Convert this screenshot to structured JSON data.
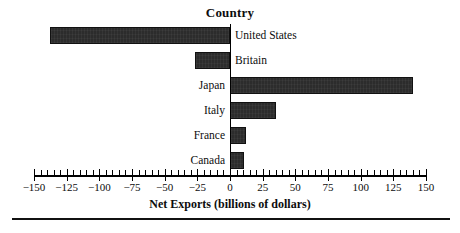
{
  "chart_data": {
    "type": "bar",
    "orientation": "horizontal",
    "title": "Country",
    "xlabel": "Net Exports (billions of dollars)",
    "ylabel": "Country",
    "categories": [
      "United States",
      "Britain",
      "Japan",
      "Italy",
      "France",
      "Canada"
    ],
    "values": [
      -138,
      -27,
      140,
      35,
      12,
      11
    ],
    "xlim": [
      -150,
      150
    ],
    "xticks": [
      -150,
      -125,
      -100,
      -75,
      -50,
      -25,
      0,
      25,
      50,
      75,
      100,
      125,
      150
    ],
    "xtick_labels": [
      "−150",
      "−125",
      "−100",
      "−75",
      "−50",
      "−25",
      "0",
      "25",
      "50",
      "75",
      "100",
      "125",
      "150"
    ],
    "minor_tick_interval": 5,
    "grid": false,
    "legend": null,
    "bar_color": "#2c2c2c",
    "axis_color": "#000000",
    "background_color": "#ffffff"
  },
  "chart": {
    "title": "Country",
    "x_axis_title": "Net Exports (billions of dollars)",
    "bars": [
      {
        "label": "United States",
        "value": -138
      },
      {
        "label": "Britain",
        "value": -27
      },
      {
        "label": "Japan",
        "value": 140
      },
      {
        "label": "Italy",
        "value": 35
      },
      {
        "label": "France",
        "value": 12
      },
      {
        "label": "Canada",
        "value": 11
      }
    ],
    "axis": {
      "min": -150,
      "max": 150,
      "major_step": 25,
      "minor_step": 5,
      "labels": [
        "−150",
        "−125",
        "−100",
        "−75",
        "−50",
        "−25",
        "0",
        "25",
        "50",
        "75",
        "100",
        "125",
        "150"
      ]
    }
  }
}
